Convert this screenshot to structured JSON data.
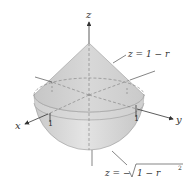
{
  "diagram": {
    "axes": {
      "x_label": "x",
      "y_label": "y",
      "z_label": "z"
    },
    "ticks": {
      "x_tick": "1",
      "y_tick": "1"
    },
    "labels": {
      "cone_equation": "z = 1 − r",
      "hemisphere_equation_prefix": "z = −",
      "hemisphere_equation_radicand": "1 − r",
      "hemisphere_equation_exponent": "2"
    },
    "colors": {
      "solid_fill": "#d9d9d9",
      "solid_shade": "#c4c4c4",
      "cone_fill": "#cfcfcf",
      "axis": "#333333",
      "dashed": "#7a7a7a"
    }
  }
}
